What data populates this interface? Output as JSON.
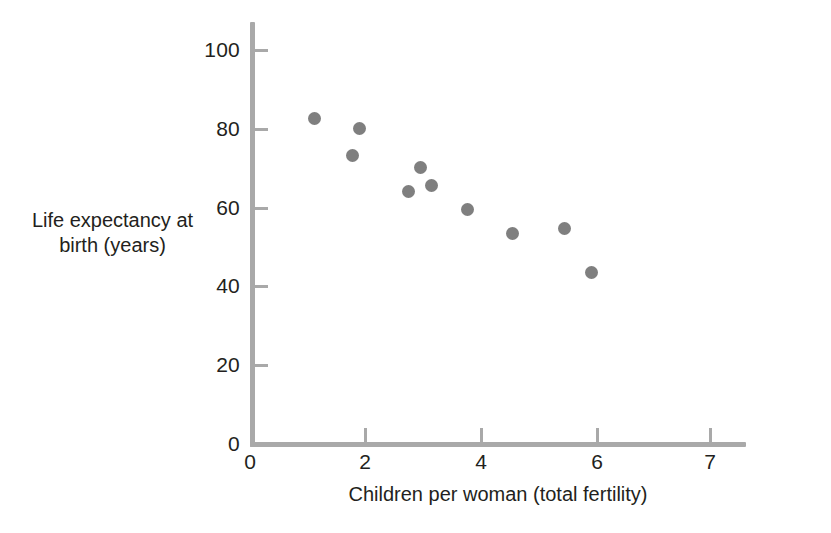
{
  "chart_data": {
    "type": "scatter",
    "title": "",
    "xlabel": "Children per woman (total fertility)",
    "ylabel_line1": "Life expectancy at",
    "ylabel_line2": "birth (years)",
    "ylabel": "Life expectancy at birth (years)",
    "xlim": [
      0,
      8.6
    ],
    "ylim": [
      0,
      107
    ],
    "xticks": [
      0,
      2,
      4,
      6,
      7
    ],
    "xtick_labels": [
      "0",
      "2",
      "4",
      "6",
      "7"
    ],
    "yticks": [
      0,
      20,
      40,
      60,
      80,
      100
    ],
    "ytick_labels": [
      "0",
      "20",
      "40",
      "60",
      "80",
      "100"
    ],
    "grid": false,
    "legend": "none",
    "marker_color": "#7f7f7f",
    "axis_color": "#a9a9a9",
    "points": [
      {
        "x": 1.1,
        "y": 82.0
      },
      {
        "x": 1.9,
        "y": 80.0
      },
      {
        "x": 1.75,
        "y": 73.0
      },
      {
        "x": 2.9,
        "y": 70.0
      },
      {
        "x": 2.45,
        "y": 64.0
      },
      {
        "x": 3.05,
        "y": 65.5
      },
      {
        "x": 3.7,
        "y": 59.5
      },
      {
        "x": 4.35,
        "y": 53.5
      },
      {
        "x": 5.25,
        "y": 55.0
      },
      {
        "x": 5.85,
        "y": 43.5
      }
    ],
    "point_pixels": [
      {
        "x": 314,
        "y": 118
      },
      {
        "x": 359,
        "y": 128
      },
      {
        "x": 352,
        "y": 155
      },
      {
        "x": 420,
        "y": 167
      },
      {
        "x": 408,
        "y": 191
      },
      {
        "x": 431,
        "y": 185
      },
      {
        "x": 467,
        "y": 209
      },
      {
        "x": 512,
        "y": 233
      },
      {
        "x": 564,
        "y": 228
      },
      {
        "x": 591,
        "y": 272
      }
    ]
  },
  "figure": {
    "name": "life-expectancy-vs-fertility-scatter"
  }
}
